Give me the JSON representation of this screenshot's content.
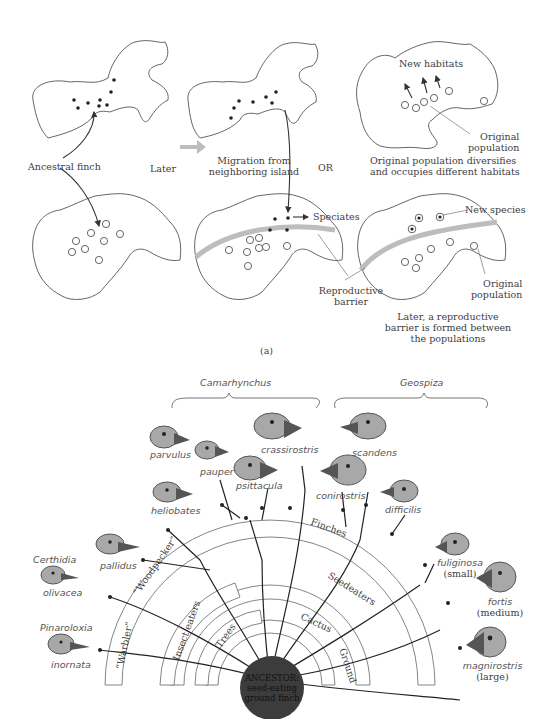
{
  "panel_a": {
    "caption": "(a)",
    "maps": [
      {
        "id": "top-left",
        "row": 1,
        "col": 1,
        "markers": "dots",
        "count": 8
      },
      {
        "id": "top-middle",
        "row": 1,
        "col": 2,
        "markers": "dots",
        "count": 7
      },
      {
        "id": "top-right",
        "row": 1,
        "col": 3,
        "markers": "circles",
        "count": 6
      },
      {
        "id": "bottom-left",
        "row": 2,
        "col": 1,
        "markers": "circles",
        "count": 9
      },
      {
        "id": "bottom-middle",
        "row": 2,
        "col": 2,
        "markers": "circles+dots",
        "barrier": true
      },
      {
        "id": "bottom-right",
        "row": 2,
        "col": 3,
        "markers": "circles+targets",
        "barrier": true
      }
    ],
    "labels": {
      "ancestral_finch": "Ancestral finch",
      "later": "Later",
      "migration_line1": "Migration from",
      "migration_line2": "neighboring island",
      "or": "OR",
      "new_habitats": "New habitats",
      "original_population_1_line1": "Original",
      "original_population_1_line2": "population",
      "diversifies_line1": "Original population diversifies",
      "diversifies_line2": "and occupies different habitats",
      "speciates": "Speciates",
      "new_species": "New species",
      "reproductive_barrier_line1": "Reproductive",
      "reproductive_barrier_line2": "barrier",
      "original_population_2_line1": "Original",
      "original_population_2_line2": "population",
      "later_barrier_line1": "Later, a reproductive",
      "later_barrier_line2": "barrier is formed between",
      "later_barrier_line3": "the populations"
    }
  },
  "panel_b": {
    "genus_labels": {
      "camarhynchus": "Camarhynchus",
      "geospiza": "Geospiza",
      "certhidia": "Certhidia",
      "pinaroloxia": "Pinaroloxia"
    },
    "species": {
      "parvulus": "parvulus",
      "pauper": "pauper",
      "crassirostris": "crassirostris",
      "psittacula": "psittacula",
      "heliobates": "heliobates",
      "pallidus": "pallidus",
      "olivacea": "olivacea",
      "inornata": "inornata",
      "scandens": "scandens",
      "conirostris": "conirostris",
      "difficilis": "difficilis",
      "fuliginosa": "fuliginosa",
      "fuliginosa_size": "(small)",
      "fortis": "fortis",
      "fortis_size": "(medium)",
      "magnirostris": "magnirostris",
      "magnirostris_size": "(large)"
    },
    "arcs": {
      "finches": "Finches",
      "seedeaters": "Seedeaters",
      "cactus": "Cactus",
      "ground": "Ground",
      "trees": "Trees",
      "insect_eaters": "Insect eaters",
      "woodpecker": "“Woodpecker”",
      "warbler": "“Warbler”"
    },
    "ancestor": {
      "line1": "ANCESTOR:",
      "line2": "seed-eating",
      "line3": "ground finch"
    },
    "colors": {
      "head": "#a8a8a8",
      "beak": "#555555",
      "ancestor": "#3c3c3c",
      "barrier": "#bdbdbd"
    }
  }
}
